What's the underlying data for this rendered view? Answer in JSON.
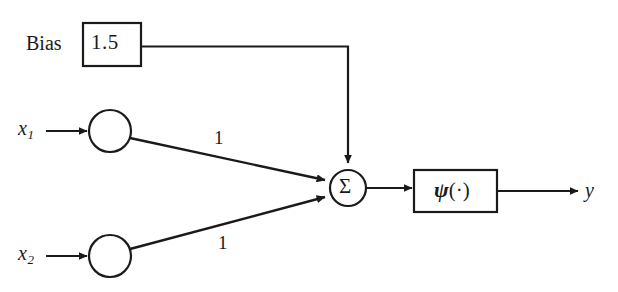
{
  "diagram": {
    "background_color": "#ffffff",
    "stroke_color": "#1a1a1a",
    "bias": {
      "label": "Bias",
      "value": "1.5"
    },
    "inputs": [
      {
        "name": "x",
        "subscript": "1"
      },
      {
        "name": "x",
        "subscript": "2"
      }
    ],
    "weights": [
      {
        "value": "1"
      },
      {
        "value": "1"
      }
    ],
    "summation": {
      "symbol": "Σ"
    },
    "activation": {
      "symbol": "ψ",
      "argument": "(·)"
    },
    "output": {
      "label": "y"
    }
  }
}
